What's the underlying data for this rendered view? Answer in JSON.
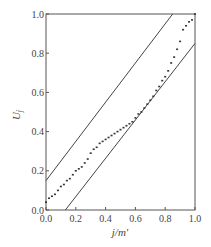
{
  "chart_data": {
    "type": "scatter",
    "title": "",
    "xlabel": "j/m'",
    "ylabel": "U_j",
    "xlim": [
      0.0,
      1.0
    ],
    "ylim": [
      0.0,
      1.0
    ],
    "grid": false,
    "legend": null,
    "xticks": [
      "0.0",
      "0.2",
      "0.4",
      "0.6",
      "0.8",
      "1.0"
    ],
    "yticks": [
      "0.0",
      "0.2",
      "0.4",
      "0.6",
      "0.8",
      "1.0"
    ],
    "bands": [
      {
        "name": "upper-bound",
        "x": [
          0.0,
          0.85
        ],
        "y": [
          0.15,
          1.0
        ]
      },
      {
        "name": "lower-bound",
        "x": [
          0.13,
          1.0
        ],
        "y": [
          0.0,
          0.85
        ]
      }
    ],
    "series": [
      {
        "name": "U_j",
        "x": [
          0.0,
          0.02,
          0.04,
          0.06,
          0.08,
          0.1,
          0.12,
          0.14,
          0.16,
          0.18,
          0.2,
          0.22,
          0.24,
          0.26,
          0.28,
          0.3,
          0.32,
          0.34,
          0.36,
          0.38,
          0.4,
          0.42,
          0.44,
          0.46,
          0.48,
          0.5,
          0.52,
          0.54,
          0.56,
          0.58,
          0.6,
          0.62,
          0.64,
          0.66,
          0.68,
          0.7,
          0.72,
          0.74,
          0.76,
          0.78,
          0.8,
          0.82,
          0.84,
          0.86,
          0.88,
          0.9,
          0.92,
          0.94,
          0.96,
          0.98,
          1.0
        ],
        "y": [
          0.04,
          0.06,
          0.07,
          0.08,
          0.1,
          0.12,
          0.13,
          0.15,
          0.16,
          0.18,
          0.2,
          0.21,
          0.22,
          0.24,
          0.26,
          0.29,
          0.31,
          0.32,
          0.34,
          0.35,
          0.36,
          0.37,
          0.38,
          0.39,
          0.4,
          0.41,
          0.42,
          0.43,
          0.44,
          0.45,
          0.47,
          0.49,
          0.5,
          0.52,
          0.54,
          0.56,
          0.58,
          0.61,
          0.63,
          0.66,
          0.68,
          0.71,
          0.75,
          0.78,
          0.82,
          0.86,
          0.92,
          0.94,
          0.96,
          0.97,
          1.0
        ]
      }
    ]
  }
}
